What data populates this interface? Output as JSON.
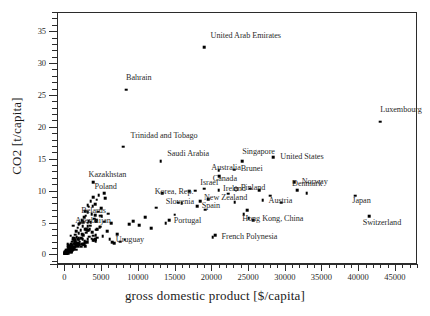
{
  "chart_data": {
    "type": "scatter",
    "title": "",
    "xlabel": "gross domestic product [$/capita]",
    "ylabel": "CO2 [t/capita]",
    "xlim": [
      -1000,
      48000
    ],
    "ylim": [
      -1.5,
      38
    ],
    "xticks": [
      0,
      5000,
      10000,
      15000,
      20000,
      25000,
      30000,
      35000,
      40000,
      45000
    ],
    "yticks": [
      0,
      5,
      10,
      15,
      20,
      25,
      30,
      35
    ],
    "xtick_labels": [
      "0",
      "5000",
      "10000",
      "15000",
      "20000",
      "25000",
      "30000",
      "35000",
      "40000",
      "45000"
    ],
    "ytick_labels": [
      "0",
      "5",
      "10",
      "15",
      "20",
      "25",
      "30",
      "35"
    ],
    "grid": false,
    "legend": null,
    "marker": "filled-square",
    "labeled_points": [
      {
        "name": "United Arab Emirates",
        "x": 19000,
        "y": 32.5,
        "lx": 19900,
        "ly": 34.2
      },
      {
        "name": "Bahrain",
        "x": 8400,
        "y": 25.8,
        "lx": 8400,
        "ly": 27.6
      },
      {
        "name": "Luxembourg",
        "x": 43000,
        "y": 20.8,
        "lx": 43000,
        "ly": 22.6
      },
      {
        "name": "Trinidad and Tobago",
        "x": 8000,
        "y": 16.9,
        "lx": 9000,
        "ly": 18.6
      },
      {
        "name": "Singapore",
        "x": 24200,
        "y": 14.6,
        "lx": 24200,
        "ly": 16.0
      },
      {
        "name": "United States",
        "x": 28400,
        "y": 15.2,
        "lx": 29400,
        "ly": 15.2
      },
      {
        "name": "Saudi Arabia",
        "x": 13100,
        "y": 14.6,
        "lx": 14000,
        "ly": 15.7
      },
      {
        "name": "Australia",
        "x": 21000,
        "y": 13.2,
        "lx": 20000,
        "ly": 13.6
      },
      {
        "name": "Brunei",
        "x": 23100,
        "y": 13.3,
        "lx": 24000,
        "ly": 13.4
      },
      {
        "name": "Canada",
        "x": 21100,
        "y": 12.3,
        "lx": 20200,
        "ly": 11.8
      },
      {
        "name": "Norway",
        "x": 31300,
        "y": 11.3,
        "lx": 32300,
        "ly": 11.3
      },
      {
        "name": "Kazakhstan",
        "x": 3900,
        "y": 11.3,
        "lx": 3300,
        "ly": 12.4
      },
      {
        "name": "Poland",
        "x": 5400,
        "y": 9.6,
        "lx": 4100,
        "ly": 10.6
      },
      {
        "name": "Israel",
        "x": 19000,
        "y": 10.3,
        "lx": 18500,
        "ly": 11.2
      },
      {
        "name": "Ireland",
        "x": 21000,
        "y": 10.1,
        "lx": 21600,
        "ly": 10.3
      },
      {
        "name": "Korea, Rep.",
        "x": 13300,
        "y": 9.6,
        "lx": 12300,
        "ly": 9.8
      },
      {
        "name": "Denmark",
        "x": 31700,
        "y": 10.1,
        "lx": 31000,
        "ly": 11.0
      },
      {
        "name": "Finland",
        "x": 25300,
        "y": 10.3,
        "lx": 24000,
        "ly": 10.4
      },
      {
        "name": "New Zealand",
        "x": 19600,
        "y": 8.7,
        "lx": 19000,
        "ly": 8.9
      },
      {
        "name": "Slovenia",
        "x": 15500,
        "y": 8.1,
        "lx": 13800,
        "ly": 8.2
      },
      {
        "name": "Austria",
        "x": 27000,
        "y": 8.5,
        "lx": 27800,
        "ly": 8.3
      },
      {
        "name": "Japan",
        "x": 39600,
        "y": 9.2,
        "lx": 39200,
        "ly": 8.3
      },
      {
        "name": "Belarus",
        "x": 3200,
        "y": 6.6,
        "lx": 2300,
        "ly": 6.8
      },
      {
        "name": "Spain",
        "x": 18100,
        "y": 7.6,
        "lx": 18700,
        "ly": 7.6
      },
      {
        "name": "Azerbaijan",
        "x": 2500,
        "y": 5.2,
        "lx": 1500,
        "ly": 5.3
      },
      {
        "name": "Portugal",
        "x": 14300,
        "y": 5.4,
        "lx": 14900,
        "ly": 5.3
      },
      {
        "name": "Hong Kong, China",
        "x": 25100,
        "y": 5.7,
        "lx": 24200,
        "ly": 5.5
      },
      {
        "name": "Switzerland",
        "x": 41500,
        "y": 6.0,
        "lx": 40600,
        "ly": 5.0
      },
      {
        "name": "Uruguay",
        "x": 6500,
        "y": 1.9,
        "lx": 7000,
        "ly": 2.2
      },
      {
        "name": "French Polynesia",
        "x": 20500,
        "y": 3.0,
        "lx": 21400,
        "ly": 2.8
      }
    ],
    "unlabeled_points": [
      {
        "x": 300,
        "y": 0.2
      },
      {
        "x": 400,
        "y": 0.3
      },
      {
        "x": 500,
        "y": 0.5
      },
      {
        "x": 550,
        "y": 0.2
      },
      {
        "x": 600,
        "y": 0.7
      },
      {
        "x": 650,
        "y": 0.4
      },
      {
        "x": 700,
        "y": 1.0
      },
      {
        "x": 750,
        "y": 0.6
      },
      {
        "x": 800,
        "y": 1.3
      },
      {
        "x": 850,
        "y": 0.9
      },
      {
        "x": 900,
        "y": 1.6
      },
      {
        "x": 950,
        "y": 0.5
      },
      {
        "x": 1000,
        "y": 1.1
      },
      {
        "x": 1050,
        "y": 2.0
      },
      {
        "x": 1100,
        "y": 1.4
      },
      {
        "x": 1150,
        "y": 0.8
      },
      {
        "x": 1200,
        "y": 2.3
      },
      {
        "x": 1250,
        "y": 1.7
      },
      {
        "x": 1300,
        "y": 1.0
      },
      {
        "x": 1350,
        "y": 2.6
      },
      {
        "x": 1400,
        "y": 1.9
      },
      {
        "x": 1450,
        "y": 1.2
      },
      {
        "x": 1500,
        "y": 3.1
      },
      {
        "x": 1550,
        "y": 2.2
      },
      {
        "x": 1600,
        "y": 1.5
      },
      {
        "x": 1650,
        "y": 3.6
      },
      {
        "x": 1700,
        "y": 2.7
      },
      {
        "x": 1750,
        "y": 1.8
      },
      {
        "x": 1800,
        "y": 4.2
      },
      {
        "x": 1850,
        "y": 2.4
      },
      {
        "x": 1900,
        "y": 1.3
      },
      {
        "x": 1950,
        "y": 3.3
      },
      {
        "x": 2000,
        "y": 4.8
      },
      {
        "x": 2100,
        "y": 2.0
      },
      {
        "x": 2150,
        "y": 5.0
      },
      {
        "x": 2200,
        "y": 3.8
      },
      {
        "x": 2300,
        "y": 2.5
      },
      {
        "x": 2350,
        "y": 5.4
      },
      {
        "x": 2400,
        "y": 1.6
      },
      {
        "x": 2500,
        "y": 4.4
      },
      {
        "x": 2600,
        "y": 3.0
      },
      {
        "x": 2700,
        "y": 5.8
      },
      {
        "x": 2750,
        "y": 2.1
      },
      {
        "x": 2800,
        "y": 4.0
      },
      {
        "x": 2900,
        "y": 6.1
      },
      {
        "x": 3000,
        "y": 3.4
      },
      {
        "x": 3100,
        "y": 1.9
      },
      {
        "x": 3200,
        "y": 5.0
      },
      {
        "x": 3300,
        "y": 7.5
      },
      {
        "x": 3400,
        "y": 2.8
      },
      {
        "x": 3500,
        "y": 4.5
      },
      {
        "x": 3600,
        "y": 8.3
      },
      {
        "x": 3700,
        "y": 6.3
      },
      {
        "x": 3800,
        "y": 3.5
      },
      {
        "x": 3900,
        "y": 9.0
      },
      {
        "x": 4000,
        "y": 2.2
      },
      {
        "x": 4100,
        "y": 5.6
      },
      {
        "x": 4200,
        "y": 7.9
      },
      {
        "x": 4300,
        "y": 3.9
      },
      {
        "x": 4400,
        "y": 8.6
      },
      {
        "x": 4500,
        "y": 2.6
      },
      {
        "x": 4600,
        "y": 6.7
      },
      {
        "x": 4700,
        "y": 9.3
      },
      {
        "x": 4800,
        "y": 4.3
      },
      {
        "x": 5000,
        "y": 7.2
      },
      {
        "x": 5200,
        "y": 2.9
      },
      {
        "x": 5400,
        "y": 5.1
      },
      {
        "x": 5600,
        "y": 8.8
      },
      {
        "x": 5800,
        "y": 3.6
      },
      {
        "x": 6000,
        "y": 6.4
      },
      {
        "x": 6200,
        "y": 2.4
      },
      {
        "x": 6400,
        "y": 4.9
      },
      {
        "x": 6800,
        "y": 1.8
      },
      {
        "x": 7200,
        "y": 3.2
      },
      {
        "x": 7600,
        "y": 2.0
      },
      {
        "x": 8200,
        "y": 2.3
      },
      {
        "x": 8800,
        "y": 4.7
      },
      {
        "x": 9400,
        "y": 5.2
      },
      {
        "x": 10200,
        "y": 4.6
      },
      {
        "x": 11000,
        "y": 5.8
      },
      {
        "x": 11800,
        "y": 4.1
      },
      {
        "x": 12500,
        "y": 7.3
      },
      {
        "x": 13800,
        "y": 4.9
      },
      {
        "x": 15000,
        "y": 6.2
      },
      {
        "x": 16000,
        "y": 8.0
      },
      {
        "x": 17000,
        "y": 9.9
      },
      {
        "x": 17800,
        "y": 10.0
      },
      {
        "x": 18500,
        "y": 8.3
      },
      {
        "x": 19200,
        "y": 7.0
      },
      {
        "x": 20200,
        "y": 2.7
      },
      {
        "x": 22300,
        "y": 9.5
      },
      {
        "x": 23200,
        "y": 8.2
      },
      {
        "x": 24400,
        "y": 6.3
      },
      {
        "x": 24900,
        "y": 6.9
      },
      {
        "x": 25700,
        "y": 5.4
      },
      {
        "x": 26500,
        "y": 10.1
      },
      {
        "x": 28000,
        "y": 9.2
      },
      {
        "x": 29500,
        "y": 8.1
      },
      {
        "x": 33000,
        "y": 9.6
      }
    ]
  }
}
